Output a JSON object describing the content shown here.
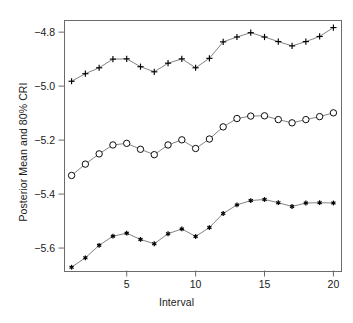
{
  "chart_data": {
    "type": "line",
    "title": "",
    "xlabel": "Interval",
    "ylabel": "Posterior Mean and 80% CRI",
    "xlim": [
      0.45,
      20.55
    ],
    "ylim": [
      -5.685,
      -4.755
    ],
    "grid": false,
    "legend": "none",
    "x": [
      1,
      2,
      3,
      4,
      5,
      6,
      7,
      8,
      9,
      10,
      11,
      12,
      13,
      14,
      15,
      16,
      17,
      18,
      19,
      20
    ],
    "xticks": [
      5,
      10,
      15,
      20
    ],
    "xticklabels": [
      "5",
      "10",
      "15",
      "20"
    ],
    "yticks": [
      -4.8,
      -5.0,
      -5.2,
      -5.4,
      -5.6
    ],
    "yticklabels": [
      "−4.8",
      "−5.0",
      "−5.2",
      "−5.4",
      "−5.6"
    ],
    "series": [
      {
        "name": "Upper 80% CRI",
        "marker": "plus",
        "values": [
          -4.982,
          -4.954,
          -4.932,
          -4.9,
          -4.899,
          -4.928,
          -4.947,
          -4.915,
          -4.899,
          -4.932,
          -4.897,
          -4.836,
          -4.818,
          -4.802,
          -4.818,
          -4.835,
          -4.851,
          -4.835,
          -4.816,
          -4.783
        ]
      },
      {
        "name": "Posterior Mean",
        "marker": "circle",
        "values": [
          -5.331,
          -5.289,
          -5.251,
          -5.218,
          -5.212,
          -5.234,
          -5.254,
          -5.218,
          -5.199,
          -5.231,
          -5.196,
          -5.151,
          -5.12,
          -5.111,
          -5.11,
          -5.124,
          -5.136,
          -5.124,
          -5.113,
          -5.099
        ]
      },
      {
        "name": "Lower 80% CRI",
        "marker": "star",
        "values": [
          -5.671,
          -5.636,
          -5.59,
          -5.556,
          -5.545,
          -5.568,
          -5.584,
          -5.547,
          -5.529,
          -5.557,
          -5.524,
          -5.472,
          -5.44,
          -5.424,
          -5.42,
          -5.432,
          -5.446,
          -5.433,
          -5.432,
          -5.433
        ]
      }
    ]
  },
  "style": {
    "frame_color": "#6b6b6b",
    "line_color": "#5a5a5a",
    "marker_color": "#000000",
    "text_color": "#1a1a1a",
    "background": "#ffffff"
  },
  "plot_geometry": {
    "left": 64,
    "right": 341,
    "top": 20,
    "bottom": 271
  }
}
